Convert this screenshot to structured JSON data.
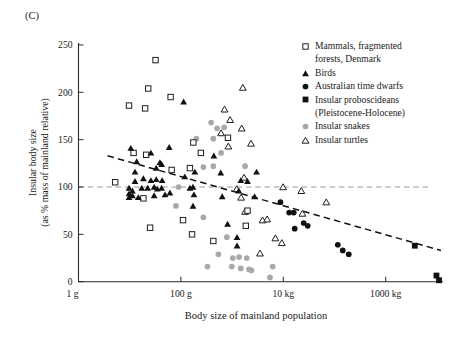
{
  "panel_label": "(C)",
  "colors": {
    "black_marker": "#111111",
    "gray_marker": "#a8a8a8",
    "open_marker_stroke": "#1f1f1f",
    "axis": "#2b2b2b",
    "reference_line": "#9a9a9a",
    "trend_line": "#111111",
    "text": "#1a1a1a",
    "background": "#ffffff"
  },
  "axes": {
    "x_label": "Body size of mainland population",
    "y_label_line1": "Insular body size",
    "y_label_line2": "(as % mass of mainland relative)",
    "x_ticks": [
      {
        "label": "1 g",
        "g": 1
      },
      {
        "label": "100 g",
        "g": 100
      },
      {
        "label": "10 kg",
        "g": 10000
      },
      {
        "label": "1000 kg",
        "g": 1000000
      }
    ],
    "y_ticks": [
      0,
      50,
      100,
      150,
      200,
      250
    ]
  },
  "legend": {
    "items": [
      {
        "marker": "open-square",
        "line1": "Mammals, fragmented",
        "line2": "forests, Denmark"
      },
      {
        "marker": "filled-triangle",
        "line1": "Birds",
        "line2": ""
      },
      {
        "marker": "filled-circle",
        "line1": "Australian time dwarfs",
        "line2": ""
      },
      {
        "marker": "filled-square",
        "line1": "Insular proboscideans",
        "line2": "(Pleistocene-Holocene)"
      },
      {
        "marker": "gray-circle",
        "line1": "Insular snakes",
        "line2": ""
      },
      {
        "marker": "open-triangle",
        "line1": "Insular turtles",
        "line2": ""
      }
    ]
  },
  "chart_data": {
    "type": "scatter",
    "title": "",
    "x_scale": "log",
    "x_unit": "grams",
    "y_unit": "percent of mainland body mass",
    "xlim_g": [
      1,
      12589254
    ],
    "ylim": [
      0,
      250
    ],
    "grid": false,
    "legend_position": "top-right",
    "reference_line": {
      "y_pct": 100,
      "x_start_g": 1,
      "x_end_g": 7900000,
      "style": "gray-dashed"
    },
    "trend_line": {
      "x1_g": 3.7,
      "y1_pct": 133,
      "x2_g": 12000000,
      "y2_pct": 33,
      "style": "black-dashed"
    },
    "series": [
      {
        "name": "Mammals, fragmented forests, Denmark",
        "marker": "open-square",
        "points": [
          [
            32,
            234
          ],
          [
            23,
            204
          ],
          [
            9.7,
            186
          ],
          [
            20,
            183
          ],
          [
            63,
            195
          ],
          [
            5.2,
            105
          ],
          [
            11.9,
            136
          ],
          [
            21,
            134
          ],
          [
            175,
            147
          ],
          [
            66,
            118
          ],
          [
            150,
            120
          ],
          [
            18.5,
            88
          ],
          [
            25,
            57
          ],
          [
            110,
            65
          ],
          [
            165,
            50
          ],
          [
            830,
            152
          ],
          [
            245,
            136
          ],
          [
            2000,
            75
          ],
          [
            1850,
            59
          ],
          [
            430,
            43
          ]
        ]
      },
      {
        "name": "Birds",
        "marker": "filled-triangle",
        "points": [
          [
            113,
            190
          ],
          [
            10.5,
            141
          ],
          [
            26,
            136
          ],
          [
            59,
            142
          ],
          [
            13.7,
            127
          ],
          [
            39,
            126
          ],
          [
            12.7,
            116
          ],
          [
            33,
            120
          ],
          [
            42,
            124
          ],
          [
            12.7,
            106
          ],
          [
            18.5,
            109
          ],
          [
            26,
            107
          ],
          [
            33,
            108
          ],
          [
            43,
            107
          ],
          [
            9.7,
            99
          ],
          [
            11.3,
            96
          ],
          [
            9.7,
            93
          ],
          [
            11.3,
            91
          ],
          [
            9.7,
            89
          ],
          [
            14.7,
            89
          ],
          [
            17.2,
            99
          ],
          [
            22.5,
            99
          ],
          [
            30,
            100
          ],
          [
            34.5,
            98
          ],
          [
            42,
            99
          ],
          [
            30,
            91
          ],
          [
            49,
            92
          ],
          [
            61,
            94
          ],
          [
            119,
            111
          ],
          [
            172,
            100
          ],
          [
            150,
            99
          ],
          [
            180,
            92
          ],
          [
            172,
            80
          ],
          [
            440,
            133
          ],
          [
            187,
            116
          ],
          [
            600,
            115
          ],
          [
            3000,
            116
          ],
          [
            1480,
            107
          ],
          [
            2000,
            106
          ],
          [
            1350,
            96
          ],
          [
            2750,
            90
          ],
          [
            640,
            90
          ],
          [
            815,
            61
          ],
          [
            1250,
            47
          ],
          [
            1250,
            38
          ]
        ]
      },
      {
        "name": "Australian time dwarfs",
        "marker": "filled-circle",
        "points": [
          [
            8800,
            84
          ],
          [
            13000,
            73
          ],
          [
            16000,
            73
          ],
          [
            25000,
            62
          ],
          [
            30000,
            59
          ],
          [
            16700,
            56
          ],
          [
            116000,
            39
          ],
          [
            145000,
            33
          ],
          [
            190000,
            29
          ]
        ]
      },
      {
        "name": "Insular proboscideans (Pleistocene-Holocene)",
        "marker": "filled-square",
        "points": [
          [
            3700000,
            38
          ],
          [
            9800000,
            6.5
          ],
          [
            11000000,
            1.5
          ]
        ]
      },
      {
        "name": "Insular snakes",
        "marker": "gray-circle",
        "points": [
          [
            200,
            151
          ],
          [
            390,
            168
          ],
          [
            510,
            162
          ],
          [
            700,
            163
          ],
          [
            610,
            136
          ],
          [
            430,
            151
          ],
          [
            430,
            122
          ],
          [
            275,
            121
          ],
          [
            1790,
            122
          ],
          [
            90,
            100
          ],
          [
            80,
            80
          ],
          [
            275,
            68
          ],
          [
            790,
            47
          ],
          [
            540,
            29
          ],
          [
            1370,
            26
          ],
          [
            1030,
            25
          ],
          [
            1930,
            25
          ],
          [
            330,
            16
          ],
          [
            985,
            16
          ],
          [
            1480,
            14
          ],
          [
            2140,
            13
          ],
          [
            2390,
            12
          ],
          [
            6200,
            16
          ],
          [
            5500,
            4.5
          ]
        ]
      },
      {
        "name": "Insular turtles",
        "marker": "open-triangle",
        "points": [
          [
            1620,
            205
          ],
          [
            710,
            182
          ],
          [
            915,
            171
          ],
          [
            1540,
            162
          ],
          [
            610,
            157
          ],
          [
            845,
            143
          ],
          [
            2340,
            146
          ],
          [
            1710,
            110
          ],
          [
            1230,
            98
          ],
          [
            1500,
            89
          ],
          [
            1790,
            74
          ],
          [
            9900,
            100
          ],
          [
            22500,
            96
          ],
          [
            69000,
            84
          ],
          [
            23600,
            72
          ],
          [
            3940,
            65
          ],
          [
            4840,
            66
          ],
          [
            7000,
            46
          ],
          [
            9350,
            41
          ],
          [
            3500,
            30
          ]
        ]
      }
    ]
  }
}
